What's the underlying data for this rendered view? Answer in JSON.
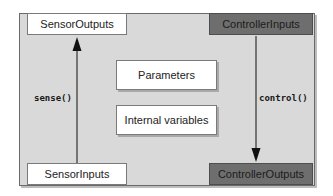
{
  "diagram": {
    "type": "component-block-diagram",
    "colors": {
      "frame_fill": "#d9d9d9",
      "frame_border": "#6a6a6a",
      "light_box_fill": "#ffffff",
      "dark_box_fill": "#6e6e6e",
      "arrow": "#111111"
    },
    "ports": {
      "sensor_outputs": "SensorOutputs",
      "controller_inputs": "ControllerInputs",
      "sensor_inputs": "SensorInputs",
      "controller_outputs": "ControllerOutputs"
    },
    "internals": {
      "parameters": "Parameters",
      "internal_variables": "Internal variables"
    },
    "flows": [
      {
        "label": "sense()",
        "from": "SensorInputs",
        "to": "SensorOutputs",
        "direction": "up"
      },
      {
        "label": "control()",
        "from": "ControllerInputs",
        "to": "ControllerOutputs",
        "direction": "down"
      }
    ]
  }
}
